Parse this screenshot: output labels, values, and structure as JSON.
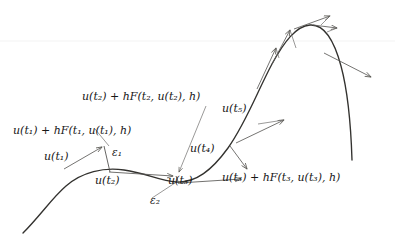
{
  "figure": {
    "name": "euler-method-local-truncation-error-diagram",
    "background_color": "#ffffff",
    "curve_color": "#33322f",
    "line_color": "#5c5b59",
    "text_color": "#171717",
    "width": 395,
    "height": 246
  },
  "labels": {
    "u_t1": "u(t₁)",
    "u_t2": "u(t₂)",
    "u_t3": "u(t₃)",
    "u_t4": "u(t₄)",
    "u_t5": "u(t₅)",
    "euler_step_1": "u(t₁) + hF(t₁, u(t₁), h)",
    "euler_step_2": "u(t₂) + hF(t₂, u(t₂), h)",
    "euler_step_3": "u(t₃) + hF(t₃, u(t₃), h)",
    "epsilon_1": "ε₁",
    "epsilon_2": "ε₂"
  },
  "label_parts": {
    "u": "u",
    "t": "t",
    "h": "h",
    "F": "F",
    "plus": "+",
    "comma": ",",
    "open": "(",
    "close": ")",
    "eps": "ε",
    "sub1": "1",
    "sub2": "2",
    "sub3": "3",
    "sub4": "4",
    "sub5": "5"
  },
  "geometry": {
    "solution_curve": "M 23 233 C 40 216 52 198 66 186 C 82 172 104 167 124 170 C 146 173 160 181 176 182 C 196 183 212 170 228 148 C 246 123 258 90 272 64 C 284 42 296 26 310 25 C 324 24 334 40 341 66 C 348 92 351 128 352 160",
    "tangent_arrows": [
      {
        "name": "tangent-at-t1",
        "x1": 64,
        "y1": 169,
        "x2": 102,
        "y2": 147
      },
      {
        "name": "tangent-at-t2",
        "x1": 109,
        "y1": 172,
        "x2": 174,
        "y2": 176
      },
      {
        "name": "tangent-at-t3",
        "x1": 178,
        "y1": 182,
        "x2": 242,
        "y2": 178
      },
      {
        "name": "tangent-at-t4",
        "x1": 230,
        "y1": 146,
        "x2": 248,
        "y2": 170
      },
      {
        "name": "tangent-at-t5",
        "x1": 236,
        "y1": 143,
        "x2": 285,
        "y2": 120
      },
      {
        "name": "tangent-at-t6",
        "x1": 258,
        "y1": 88,
        "x2": 277,
        "y2": 47
      },
      {
        "name": "tangent-at-t7",
        "x1": 272,
        "y1": 64,
        "x2": 291,
        "y2": 29
      },
      {
        "name": "tangent-at-t8",
        "x1": 294,
        "y1": 28,
        "x2": 331,
        "y2": 15
      },
      {
        "name": "tangent-at-t9",
        "x1": 314,
        "y1": 25,
        "x2": 338,
        "y2": 28
      },
      {
        "name": "tangent-at-t10",
        "x1": 324,
        "y1": 53,
        "x2": 372,
        "y2": 77
      }
    ],
    "epsilon_bars": [
      {
        "name": "epsilon-1-bar",
        "x1": 104,
        "y1": 146,
        "x2": 110,
        "y2": 172
      },
      {
        "name": "epsilon-2-bar",
        "x1": 176,
        "y1": 177,
        "x2": 178,
        "y2": 183
      }
    ],
    "leader_lines": [
      {
        "name": "leader-euler-step-1",
        "x1": 95,
        "y1": 126,
        "x2": 110,
        "y2": 144
      },
      {
        "name": "leader-euler-step-2",
        "x1": 205,
        "y1": 104,
        "x2": 178,
        "y2": 172
      },
      {
        "name": "leader-epsilon-2",
        "x1": 148,
        "y1": 200,
        "x2": 178,
        "y2": 180
      }
    ],
    "faint_rule": {
      "name": "faint-horizontal-rule",
      "x1": 0,
      "y1": 41,
      "x2": 395,
      "y2": 41
    }
  },
  "label_positions": {
    "euler_step_1": {
      "left": 13,
      "top": 126
    },
    "euler_step_2": {
      "left": 82,
      "top": 92
    },
    "euler_step_3": {
      "left": 222,
      "top": 173
    },
    "u_t1": {
      "left": 44,
      "top": 152
    },
    "u_t2": {
      "left": 95,
      "top": 176
    },
    "u_t3": {
      "left": 168,
      "top": 176
    },
    "u_t4": {
      "left": 190,
      "top": 144
    },
    "u_t5": {
      "left": 222,
      "top": 104
    },
    "epsilon_1": {
      "left": 111,
      "top": 148
    },
    "epsilon_2": {
      "left": 150,
      "top": 196
    }
  }
}
